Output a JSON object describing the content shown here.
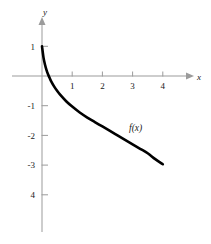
{
  "chart_data": {
    "type": "line",
    "title": "",
    "subtitle": "",
    "xlabel": "x",
    "ylabel": "y",
    "xlim": [
      -1,
      4.8
    ],
    "ylim": [
      -5.2,
      1.8
    ],
    "grid": false,
    "legend": null,
    "annotations": [
      {
        "text": "f(x)",
        "x": 3.1,
        "y": -1.85
      }
    ],
    "xticks": [
      1,
      2,
      3,
      4
    ],
    "xtick_labels": [
      "1",
      "2",
      "3",
      "4"
    ],
    "yticks": [
      1,
      -1,
      -2,
      -3,
      -4
    ],
    "ytick_labels": [
      "1",
      "-1",
      "-2",
      "-3",
      "4"
    ],
    "series": [
      {
        "name": "f(x)",
        "color": "#000000",
        "points": [
          {
            "x": 0.0,
            "y": 1.0
          },
          {
            "x": 0.05,
            "y": 0.62
          },
          {
            "x": 0.1,
            "y": 0.38
          },
          {
            "x": 0.15,
            "y": 0.2
          },
          {
            "x": 0.2,
            "y": 0.06
          },
          {
            "x": 0.25,
            "y": -0.06
          },
          {
            "x": 0.3,
            "y": -0.17
          },
          {
            "x": 0.4,
            "y": -0.35
          },
          {
            "x": 0.5,
            "y": -0.5
          },
          {
            "x": 0.6,
            "y": -0.63
          },
          {
            "x": 0.8,
            "y": -0.85
          },
          {
            "x": 1.0,
            "y": -1.03
          },
          {
            "x": 1.25,
            "y": -1.23
          },
          {
            "x": 1.5,
            "y": -1.4
          },
          {
            "x": 1.75,
            "y": -1.55
          },
          {
            "x": 2.0,
            "y": -1.7
          },
          {
            "x": 2.25,
            "y": -1.85
          },
          {
            "x": 2.5,
            "y": -2.0
          },
          {
            "x": 2.75,
            "y": -2.15
          },
          {
            "x": 3.0,
            "y": -2.3
          },
          {
            "x": 3.25,
            "y": -2.45
          },
          {
            "x": 3.5,
            "y": -2.6
          },
          {
            "x": 3.75,
            "y": -2.8
          },
          {
            "x": 4.0,
            "y": -2.97
          }
        ]
      }
    ]
  },
  "axes": {
    "x_axis_name": "x",
    "y_axis_name": "y"
  },
  "colors": {
    "curve": "#000000",
    "axis": "#9b9b9b",
    "text": "#1a1a1a",
    "background": "#ffffff"
  }
}
